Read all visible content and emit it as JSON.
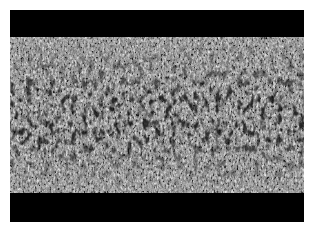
{
  "image": {
    "description": "Grayscale speckle/noise texture image with black letterbox bands above and below",
    "colors": {
      "background": "#ffffff",
      "band": "#000000",
      "texture_mid": "#808080"
    },
    "layout": {
      "top_band_height": 27,
      "texture_height": 156,
      "bottom_band_height": 29
    }
  }
}
